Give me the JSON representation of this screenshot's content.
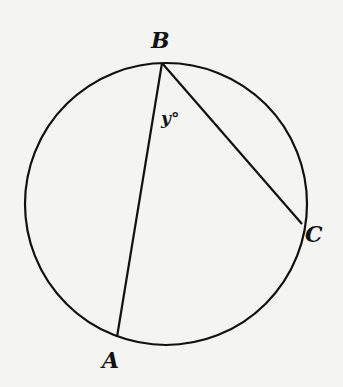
{
  "diagram": {
    "type": "inscribed-angle",
    "circle": {
      "cx": 166,
      "cy": 204,
      "r": 141
    },
    "points": {
      "A": {
        "label": "A",
        "x": 117,
        "y": 337
      },
      "B": {
        "label": "B",
        "x": 162,
        "y": 63
      },
      "C": {
        "label": "C",
        "x": 302,
        "y": 224
      }
    },
    "chords": [
      [
        "B",
        "A"
      ],
      [
        "B",
        "C"
      ]
    ],
    "angle_label": "y°",
    "colors": {
      "stroke": "#111111",
      "background": "#f4f4f2"
    }
  }
}
